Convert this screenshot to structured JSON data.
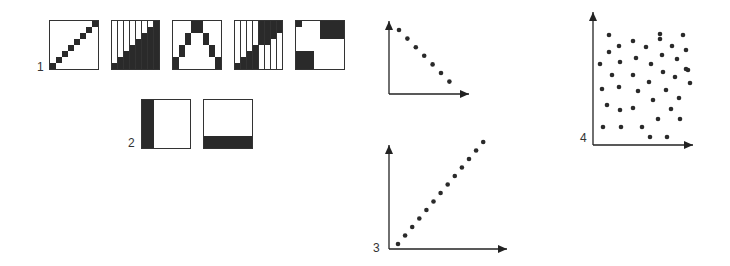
{
  "panels": [
    {
      "label": "1",
      "description": "Five 8x8 binary patterns"
    },
    {
      "label": "2",
      "description": "Two 8x8 binary patterns"
    },
    {
      "label": "3",
      "description": "Scatter with positive linear trend"
    },
    {
      "label": "4",
      "description": "Random scatter, no correlation"
    }
  ],
  "patterns_row1": [
    {
      "name": "diagonal-line",
      "rows": [
        "00000001",
        "00000010",
        "00000100",
        "00001000",
        "00010000",
        "00100000",
        "01000000",
        "10000000"
      ]
    },
    {
      "name": "lower-triangle",
      "rows": [
        "00000001",
        "00000011",
        "00000111",
        "00001111",
        "00011111",
        "00111111",
        "01111111",
        "11111111"
      ]
    },
    {
      "name": "inverted-v",
      "rows": [
        "00011000",
        "00011000",
        "00100100",
        "00100100",
        "01000010",
        "01000010",
        "10000001",
        "10000001"
      ]
    },
    {
      "name": "staircase",
      "rows": [
        "00001111",
        "00001111",
        "00001110",
        "00001100",
        "00010000",
        "00110000",
        "01110000",
        "11110000"
      ]
    },
    {
      "name": "corner-blocks",
      "rows": [
        "10001111",
        "00001111",
        "00001111",
        "00000000",
        "00000000",
        "11100000",
        "11100000",
        "11100000"
      ]
    }
  ],
  "patterns_row2": [
    {
      "name": "left-column",
      "rows": [
        "11000000",
        "11000000",
        "11000000",
        "11000000",
        "11000000",
        "11000000",
        "11000000",
        "11000000"
      ]
    },
    {
      "name": "bottom-row",
      "rows": [
        "00000000",
        "00000000",
        "00000000",
        "00000000",
        "00000000",
        "00000000",
        "11111111",
        "11111111"
      ]
    }
  ],
  "chart_data": [
    {
      "type": "scatter",
      "title": "",
      "label": "top-small",
      "x": [
        1,
        2,
        3,
        4,
        5,
        6,
        7
      ],
      "y": [
        7,
        6,
        5,
        4,
        3,
        2,
        1
      ]
    },
    {
      "type": "scatter",
      "title": "",
      "label": "3",
      "x": [
        1,
        2,
        3,
        4,
        5,
        6,
        7,
        8,
        9,
        10,
        11,
        12,
        13
      ],
      "y": [
        1,
        2,
        3,
        4,
        5,
        6,
        7,
        8,
        9,
        10,
        11,
        12,
        13
      ]
    },
    {
      "type": "scatter",
      "title": "",
      "label": "4",
      "points": [
        [
          609,
          35
        ],
        [
          660,
          34
        ],
        [
          683,
          35
        ],
        [
          609,
          52
        ],
        [
          619,
          46
        ],
        [
          633,
          41
        ],
        [
          646,
          47
        ],
        [
          660,
          39
        ],
        [
          672,
          46
        ],
        [
          686,
          50
        ],
        [
          600,
          64
        ],
        [
          620,
          62
        ],
        [
          636,
          58
        ],
        [
          651,
          64
        ],
        [
          662,
          55
        ],
        [
          677,
          59
        ],
        [
          688,
          70
        ],
        [
          612,
          75
        ],
        [
          633,
          75
        ],
        [
          649,
          82
        ],
        [
          663,
          72
        ],
        [
          675,
          77
        ],
        [
          686,
          69
        ],
        [
          690,
          83
        ],
        [
          602,
          89
        ],
        [
          619,
          87
        ],
        [
          638,
          91
        ],
        [
          653,
          100
        ],
        [
          666,
          90
        ],
        [
          679,
          98
        ],
        [
          607,
          105
        ],
        [
          620,
          110
        ],
        [
          633,
          108
        ],
        [
          671,
          109
        ],
        [
          680,
          119
        ],
        [
          603,
          127
        ],
        [
          621,
          127
        ],
        [
          642,
          127
        ],
        [
          658,
          119
        ],
        [
          650,
          137
        ],
        [
          667,
          137
        ]
      ]
    }
  ]
}
